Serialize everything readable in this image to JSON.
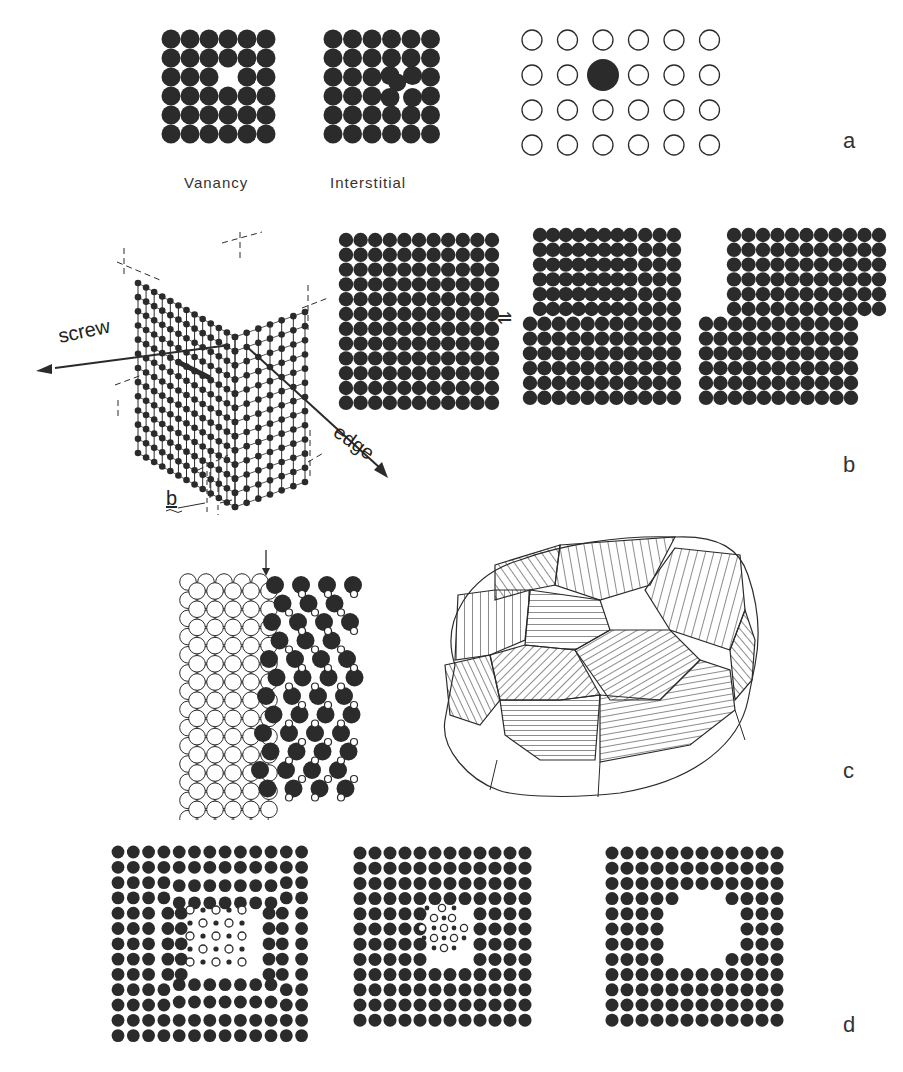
{
  "figure": {
    "panel_labels": {
      "a": "a",
      "b": "b",
      "c": "c",
      "d": "d"
    },
    "panel_a": {
      "caption_vacancy": "Vanancy",
      "caption_interstitial": "Interstitial",
      "vacancy_grid": {
        "rows": 6,
        "cols": 6,
        "missing": [
          [
            2,
            3
          ]
        ]
      },
      "interstitial_grid": {
        "rows": 6,
        "cols": 6,
        "extra_atom": [
          2.5,
          3.5
        ]
      },
      "substitutional_grid": {
        "rows": 4,
        "cols": 6,
        "substituted": [
          1,
          2
        ]
      }
    },
    "panel_b": {
      "label_screw": "screw",
      "label_edge": "edge",
      "label_burgers": "b",
      "arrow_symbol": "⇌",
      "perfect_lattice": {
        "rows": 12,
        "cols": 11
      },
      "dislocated_lattice": {
        "rows": 12,
        "cols": 11,
        "extra_half_plane_rows": 6
      },
      "slipped_lattice": {
        "top_rows": 6,
        "bottom_rows": 6,
        "cols": 11
      }
    },
    "panel_c": {
      "grain_boundary": {
        "left_rows": 13,
        "left_cols": 5,
        "right_rows": 12
      },
      "polycrystal": "grain-structure-illustration"
    },
    "panel_d": {
      "grid_1": {
        "rows": 13,
        "cols": 13,
        "defect": "dislocation-loop"
      },
      "grid_2": {
        "rows": 12,
        "cols": 12,
        "defect": "interstitial-cluster"
      },
      "grid_3": {
        "rows": 12,
        "cols": 12,
        "defect": "void"
      }
    },
    "colors": {
      "atom": "#2b2b2b",
      "background": "#ffffff",
      "outline": "#333333"
    }
  }
}
